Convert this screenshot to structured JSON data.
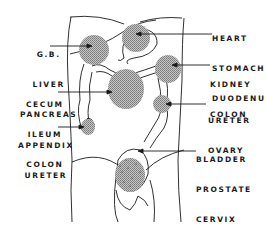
{
  "diagram": {
    "type": "anatomical-referred-pain-map",
    "colors": {
      "line": "#1a1a1a",
      "shade": "#9a9a9a",
      "background": "#ffffff"
    },
    "labels": {
      "gb_liver_pancreas": [
        "G.B.",
        "LIVER",
        "PANCREAS"
      ],
      "heart_stomach_duodenum": [
        "HEART",
        "STOMACH",
        "DUODENUM"
      ],
      "kidney_colon": [
        "KIDNEY",
        "COLON"
      ],
      "cecum_ileum_colon": [
        "CECUM",
        "ILEUM",
        "COLON"
      ],
      "ureter_ovary": [
        "URETER",
        "OVARY"
      ],
      "appendix_ureter": [
        "APPENDIX",
        "URETER"
      ],
      "bladder_prostate_cervix_rectum": [
        "BLADDER",
        "PROSTATE",
        "CERVIX",
        "RECTUM"
      ]
    },
    "regions": [
      {
        "id": "right-upper-quadrant",
        "organs": "G.B., Liver, Pancreas"
      },
      {
        "id": "epigastric",
        "organs": "Heart, Stomach, Duodenum"
      },
      {
        "id": "left-flank",
        "organs": "Kidney, Colon"
      },
      {
        "id": "periumbilical",
        "organs": "Cecum, Ileum, Colon"
      },
      {
        "id": "left-lower-quadrant",
        "organs": "Ureter, Ovary"
      },
      {
        "id": "right-lower-quadrant",
        "organs": "Appendix, Ureter"
      },
      {
        "id": "suprapubic",
        "organs": "Bladder, Prostate, Cervix, Rectum"
      }
    ]
  }
}
